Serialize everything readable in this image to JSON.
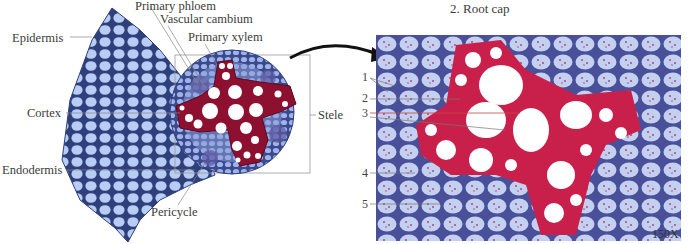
{
  "figure": {
    "top_caption": {
      "partial_line": "",
      "root_cap_item": "2. Root cap"
    },
    "diagram_labels": {
      "primary_phloem": "Primary phloem",
      "vascular_cambium": "Vascular cambium",
      "primary_xylem": "Primary xylem",
      "epidermis": "Epidermis",
      "cortex": "Cortex",
      "stele": "Stele",
      "endodermis": "Endodermis",
      "pericycle": "Pericycle"
    },
    "micrograph": {
      "numbers": [
        "1",
        "2",
        "3",
        "4",
        "5"
      ],
      "magnification": "150X"
    },
    "colors": {
      "cortex_cell_fill": "#b8cdf5",
      "cortex_cell_wall": "#2e3f7a",
      "xylem_fill": "#8e1030",
      "xylem_lumen": "#ffffff",
      "stele_fill": "#7f8fd0",
      "micrograph_bg": "#c9d3ef",
      "micrograph_xylem": "#c8204a",
      "leader_line": "#888888"
    }
  }
}
